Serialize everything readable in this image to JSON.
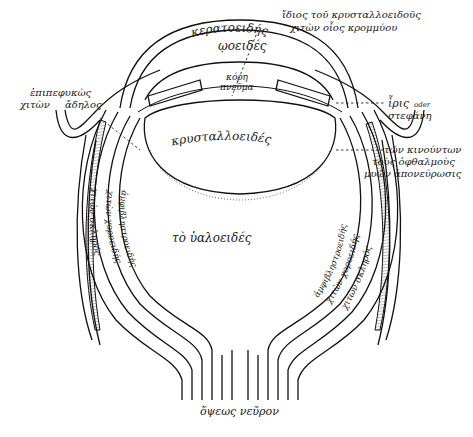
{
  "diagram": {
    "type": "anatomical-diagram",
    "labels": {
      "cornea": "κερατοειδής",
      "uvea": "ῳοειδές",
      "lens_capsule_1": "ἴδιος τοῦ κρυσταλλοειδοῦς",
      "lens_capsule_2": "χιτὼν οἷος κρομμύου",
      "conjunctiva_1": "ἐπιπεφυκὼς",
      "conjunctiva_2": "χιτὼν",
      "conjunctiva_3": "ἄδηλος",
      "pupil_1": "κόρη",
      "pupil_2": "πνεῦμα",
      "iris_1": "ἶρις",
      "iris_oder": "oder",
      "iris_2": "στεφάνη",
      "muscles_1": "τῶν κινούντων",
      "muscles_2": "τοὺς ὀφθαλμοὺς",
      "muscles_3": "μυῶν ἀπονεύρωσις",
      "lens": "κρυσταλλοειδές",
      "vitreous": "τὸ ὑαλοειδές",
      "left_retina": "ἀμφιβληστροειδής",
      "left_choroid": "χιτὼν χοροειδής",
      "left_sclera": "χιτὼν σκληρός",
      "right_retina": "ἀμφιβληστροειδής",
      "right_choroid": "χιτὼν χοροειδής",
      "right_sclera": "χιτὼν σκληρός",
      "optic_nerve": "ὄψεως νεῦρον"
    }
  }
}
